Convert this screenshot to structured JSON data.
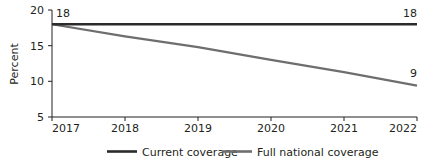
{
  "chart_data": {
    "type": "line",
    "title": "",
    "subtitle": "",
    "xlabel": "",
    "ylabel": "Percent",
    "x": [
      2017,
      2018,
      2019,
      2020,
      2021,
      2022
    ],
    "xtick_labels": [
      "2017",
      "2018",
      "2019",
      "2020",
      "2021",
      "2022"
    ],
    "ytick_labels": [
      "5",
      "10",
      "15",
      "20"
    ],
    "ytick_values": [
      5,
      10,
      15,
      20
    ],
    "ylim": [
      5,
      20
    ],
    "xlim": [
      2017,
      2022
    ],
    "grid": false,
    "legend_position": "bottom",
    "series": [
      {
        "name": "Current coverage",
        "color": "#2b2b2b",
        "values": [
          18,
          18,
          18,
          18,
          18,
          18
        ],
        "endpoint_label": "18",
        "start_label": "18"
      },
      {
        "name": "Full national coverage",
        "color": "#6e6e6e",
        "values": [
          18,
          16.3,
          14.8,
          13.0,
          11.3,
          9.4
        ],
        "endpoint_label": "9",
        "start_label": ""
      }
    ],
    "annotations": [
      {
        "text": "18",
        "x": 2017,
        "y": 18,
        "position": "top-left"
      },
      {
        "text": "18",
        "x": 2022,
        "y": 18,
        "position": "top-right"
      },
      {
        "text": "9",
        "x": 2022,
        "y": 9.4,
        "position": "top-right"
      }
    ]
  },
  "axis": {
    "y_title": "Percent",
    "y_ticks": [
      "20",
      "15",
      "10",
      "5"
    ],
    "x_ticks": [
      "2017",
      "2018",
      "2019",
      "2020",
      "2021",
      "2022"
    ]
  },
  "labels": {
    "left_start": "18",
    "right_current": "18",
    "right_full": "9"
  },
  "legend": {
    "items": [
      {
        "label": "Current coverage",
        "color": "#2b2b2b"
      },
      {
        "label": "Full national coverage",
        "color": "#6e6e6e"
      }
    ]
  },
  "colors": {
    "background": "#ffffff",
    "axis": "#231f20",
    "current_coverage": "#2b2b2b",
    "full_national_coverage": "#6e6e6e"
  }
}
